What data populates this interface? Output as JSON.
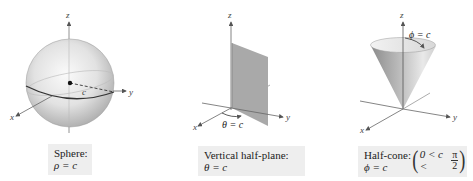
{
  "panels": [
    {
      "id": "sphere",
      "surface": "Sphere",
      "caption": {
        "title": "Sphere:",
        "equation": "ρ = c"
      },
      "axes": {
        "x": "x",
        "y": "y",
        "z": "z"
      },
      "annotations": {
        "radius_label": "c"
      }
    },
    {
      "id": "half-plane",
      "surface": "Vertical half-plane",
      "caption": {
        "title": "Vertical half-plane:",
        "equation": "θ = c"
      },
      "axes": {
        "x": "x",
        "y": "y",
        "z": "z"
      },
      "annotations": {
        "angle_label": "θ = c"
      }
    },
    {
      "id": "half-cone",
      "surface": "Half-cone",
      "caption": {
        "title": "Half-cone:",
        "equation": "ϕ = c",
        "condition_left": "0 < c <",
        "condition_num": "π",
        "condition_den": "2"
      },
      "axes": {
        "x": "x",
        "y": "y",
        "z": "z"
      },
      "annotations": {
        "angle_label": "ϕ = c"
      }
    }
  ],
  "colors": {
    "caption_bg": "#eeeeee",
    "axis": "#555555",
    "plane_fill": "#a9a9a9",
    "sphere_light": "#f4f4f4",
    "sphere_dark": "#9a9a9a"
  }
}
